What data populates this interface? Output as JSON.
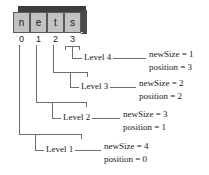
{
  "diagram": {
    "array": {
      "cells": [
        {
          "value": "n",
          "index": "0"
        },
        {
          "value": "e",
          "index": "1"
        },
        {
          "value": "t",
          "index": "2"
        },
        {
          "value": "s",
          "index": "3"
        }
      ]
    },
    "levels": [
      {
        "label": "Level 4",
        "newSize": "newSize = 1",
        "position": "position = 3"
      },
      {
        "label": "Level 3",
        "newSize": "newSize = 2",
        "position": "position = 2"
      },
      {
        "label": "Level 2",
        "newSize": "newSize = 3",
        "position": "position = 1"
      },
      {
        "label": "Level 1",
        "newSize": "newSize = 4",
        "position": "position = 0"
      }
    ],
    "colors": {
      "cell_fill": "#c2c2c2",
      "cell_border": "#5a5a5a",
      "box_shade": "#3d3d3d",
      "line": "#6e6e6e",
      "text": "#1a1a1a",
      "background": "#ffffff"
    }
  }
}
